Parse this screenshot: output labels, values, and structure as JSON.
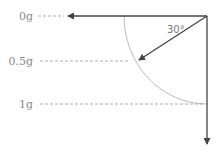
{
  "diagram": {
    "labels": [
      {
        "text": "0g",
        "y": 16
      },
      {
        "text": "0.5g",
        "y": 61
      },
      {
        "text": "1g",
        "y": 104
      }
    ],
    "angle_label": "30°",
    "colors": {
      "arrow": "#444444",
      "arc": "#bbbbbb",
      "dash": "#9a9a9a",
      "text": "#8a8a8a"
    }
  }
}
